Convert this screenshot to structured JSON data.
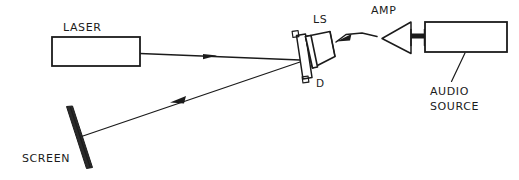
{
  "diagram": {
    "background_color": "#ffffff",
    "ink_color": "#1b1b1b",
    "width": 519,
    "height": 180,
    "labels": {
      "laser": "LASER",
      "screen": "SCREEN",
      "loudspeaker": "LS",
      "diaphragm": "D",
      "amplifier": "AMP",
      "audio_source_line1": "AUDIO",
      "audio_source_line2": "SOURCE"
    },
    "components": [
      {
        "name": "laser",
        "label": "LASER",
        "shape": "rectangle",
        "x": 52,
        "y": 37,
        "width": 88,
        "height": 29
      },
      {
        "name": "mirror-diaphragm",
        "label": "D",
        "shape": "tilted-frame-with-tabs",
        "center_x": 303,
        "center_y": 57
      },
      {
        "name": "loudspeaker",
        "label": "LS",
        "shape": "cone",
        "center_x": 320,
        "center_y": 52
      },
      {
        "name": "amplifier",
        "label": "AMP",
        "shape": "triangle-pointing-left",
        "apex_x": 383,
        "apex_y": 38
      },
      {
        "name": "audio-source",
        "label": "AUDIO SOURCE",
        "shape": "rectangle",
        "x": 425,
        "y": 22,
        "width": 82,
        "height": 30
      },
      {
        "name": "screen",
        "label": "SCREEN",
        "shape": "tilted-bar",
        "x1": 68,
        "y1": 107,
        "x2": 90,
        "y2": 168
      }
    ],
    "beams": [
      {
        "name": "incident-beam",
        "from": "laser",
        "to": "mirror-diaphragm",
        "direction": "right",
        "arrow_at_x": 212,
        "arrow_at_y": 56
      },
      {
        "name": "reflected-beam",
        "from": "mirror-diaphragm",
        "to": "screen",
        "direction": "down-left",
        "arrow_at_x": 178,
        "arrow_at_y": 100
      }
    ],
    "signal_paths": [
      {
        "name": "amp-to-speaker-wire",
        "from": "amplifier",
        "to": "loudspeaker",
        "direction": "left",
        "arrow_at_x": 344,
        "arrow_at_y": 37
      },
      {
        "name": "source-to-amp-connector",
        "from": "audio-source",
        "to": "amplifier",
        "style": "thick-hatched"
      }
    ]
  }
}
